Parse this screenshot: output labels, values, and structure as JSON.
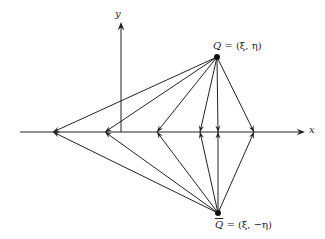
{
  "diagram": {
    "axes": {
      "x_label": "x",
      "y_label": "y",
      "origin": [
        121,
        132
      ],
      "x_axis": {
        "from": [
          20,
          132
        ],
        "to": [
          305,
          132
        ]
      },
      "y_axis": {
        "from": [
          121,
          132
        ],
        "to": [
          121,
          22
        ]
      }
    },
    "points": {
      "Q": {
        "label": "Q = (ξ, η)",
        "symbol": "Q",
        "coords_text": "= (ξ, η)",
        "pos": [
          217,
          57
        ]
      },
      "Q_bar": {
        "label": "Q̄ = (ξ, −η)",
        "symbol": "Q",
        "coords_text": "= (ξ, −η)",
        "pos": [
          218,
          213
        ]
      }
    },
    "axis_targets_x": [
      53,
      105,
      157,
      200,
      218,
      254
    ],
    "line_color": "#222222"
  }
}
